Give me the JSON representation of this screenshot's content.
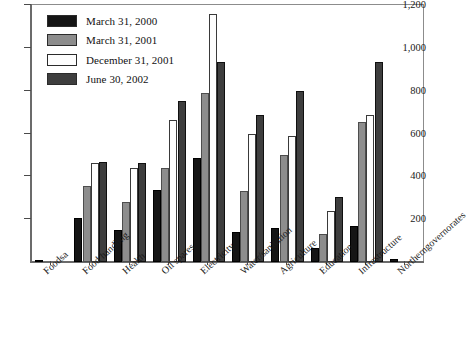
{
  "chart_data": {
    "type": "bar",
    "title": "",
    "subtitle": "",
    "xlabel": "",
    "ylabel": "",
    "ylim": [
      0,
      1200
    ],
    "ytick_labels": [
      "1,200",
      "1,000",
      "800",
      "600",
      "400",
      "200"
    ],
    "ytick_values": [
      1200,
      1000,
      800,
      600,
      400,
      200
    ],
    "grid": false,
    "legend_position": "top-left",
    "categories": [
      "Foods",
      "Food handling",
      "Health",
      "Oil spares",
      "Electricity",
      "Water/sanitation",
      "Agriculture",
      "Education",
      "Infrastructure",
      "Northern governorates"
    ],
    "category_display": [
      {
        "line1": "Foods",
        "line2": "",
        "superscript": "a"
      },
      {
        "line1": "Food handling",
        "line2": "",
        "superscript": ""
      },
      {
        "line1": "Health",
        "line2": "",
        "superscript": ""
      },
      {
        "line1": "Oil spares",
        "line2": "",
        "superscript": ""
      },
      {
        "line1": "Electricity",
        "line2": "",
        "superscript": ""
      },
      {
        "line1": "Water/sanitation",
        "line2": "",
        "superscript": ""
      },
      {
        "line1": "Agriculture",
        "line2": "",
        "superscript": ""
      },
      {
        "line1": "Education",
        "line2": "",
        "superscript": ""
      },
      {
        "line1": "Infrastructure",
        "line2": "",
        "superscript": ""
      },
      {
        "line1": "Northern",
        "line2": "governorates",
        "superscript": ""
      }
    ],
    "series": [
      {
        "name": "March 31, 2000",
        "color": "#151515",
        "values": [
          10,
          205,
          150,
          338,
          487,
          138,
          157,
          65,
          170,
          15
        ]
      },
      {
        "name": "March 31, 2001",
        "color": "#8d8d8d",
        "values": [
          0,
          355,
          278,
          440,
          790,
          333,
          498,
          130,
          652,
          0
        ]
      },
      {
        "name": "December 31, 2001",
        "color": "#fdfdfd",
        "values": [
          0,
          460,
          437,
          663,
          1160,
          600,
          590,
          240,
          688,
          0
        ]
      },
      {
        "name": "June 30, 2002",
        "color": "#3e3e3e",
        "values": [
          0,
          465,
          463,
          750,
          935,
          687,
          800,
          305,
          932,
          0
        ]
      }
    ]
  },
  "legend": {
    "items": [
      {
        "label": "March 31, 2000",
        "swatch": "series-0-swatch"
      },
      {
        "label": "March 31, 2001",
        "swatch": "series-1-swatch"
      },
      {
        "label": "December 31, 2001",
        "swatch": "series-2-swatch"
      },
      {
        "label": "June 30, 2002",
        "swatch": "series-3-swatch"
      }
    ]
  },
  "colors": {
    "series_0": "#151515",
    "series_1": "#8d8d8d",
    "series_2": "#fdfdfd",
    "series_3": "#3e3e3e",
    "axis": "#6b6b6b",
    "frame": "#8c8c8c",
    "text": "#1a1a1a",
    "background": "#ffffff"
  }
}
